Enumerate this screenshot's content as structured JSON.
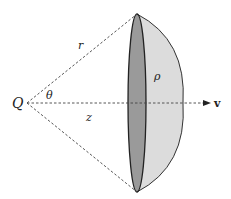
{
  "diagram": {
    "type": "geometry",
    "labels": {
      "point": "Q",
      "slant": "r",
      "angle": "θ",
      "axis_distance": "z",
      "cap_label": "ρ",
      "direction": "v"
    },
    "colors": {
      "stroke": "#222222",
      "dash": "#444444",
      "disk_fill": "#9a9a9a",
      "cap_fill": "#dcdcdc",
      "background": "#ffffff"
    }
  }
}
